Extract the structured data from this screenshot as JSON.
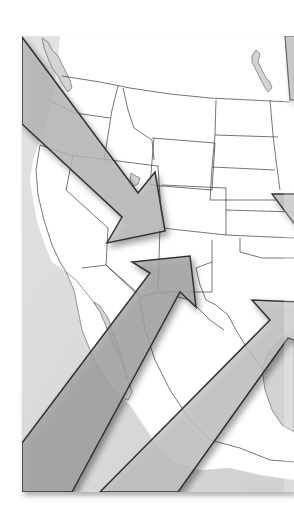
{
  "image": {
    "width": 294,
    "height": 522,
    "background": "#ffffff",
    "description": "Grayscale map of western North America with four large arrows pointing inward toward the interior",
    "colors": {
      "land": "#ffffff",
      "ocean": "#d9d9d9",
      "state_line": "#3a3a3a",
      "arrow_outline": "#333333",
      "arrow_light": "#cfcfcf",
      "arrow_mid": "#bdbdbd",
      "arrow_dark": "#9e9e9e",
      "shadow": "rgba(0,0,0,0.35)"
    }
  },
  "map": {
    "panel": {
      "x": 22,
      "y": 36,
      "width": 272,
      "height": 456
    },
    "regions": [
      "Pacific Northwest",
      "California",
      "Great Basin",
      "Rocky Mountains",
      "Northern Plains",
      "Southwest",
      "Baja California",
      "Mexico",
      "Gulf Coast"
    ],
    "water_bodies": [
      "Pacific Ocean",
      "Great Salt Lake",
      "Gulf of California",
      "Puget Sound",
      "Lake Winnipeg area"
    ]
  },
  "arrows": [
    {
      "id": "arrow-northwest",
      "direction": "southeast",
      "from": "Pacific Northwest",
      "to": "Utah"
    },
    {
      "id": "arrow-southwest",
      "direction": "northeast",
      "from": "Pacific Ocean",
      "to": "Arizona / New Mexico"
    },
    {
      "id": "arrow-southeast",
      "direction": "northeast",
      "from": "Mexico",
      "to": "Texas / Gulf"
    },
    {
      "id": "arrow-east",
      "direction": "east",
      "from": "Central Plains",
      "to": "Midwest"
    }
  ]
}
